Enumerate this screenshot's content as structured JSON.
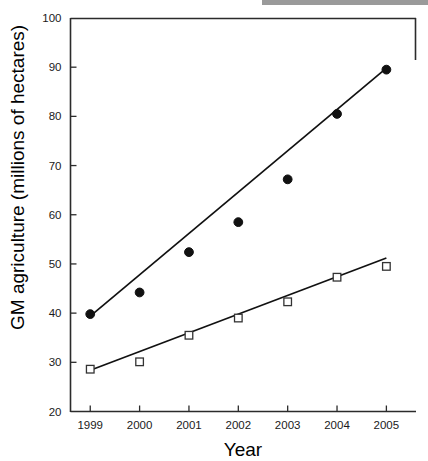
{
  "chart_data": {
    "type": "scatter",
    "title": "",
    "xlabel": "Year",
    "ylabel": "GM agriculture (millions of hectares)",
    "categories": [
      "1999",
      "2000",
      "2001",
      "2002",
      "2003",
      "2004",
      "2005"
    ],
    "x": [
      1999,
      2000,
      2001,
      2002,
      2003,
      2004,
      2005
    ],
    "xlim": [
      1998.6,
      2005.6
    ],
    "ylim": [
      20,
      100
    ],
    "yticks": [
      20,
      30,
      40,
      50,
      60,
      70,
      80,
      90,
      100
    ],
    "ytick_labels": [
      "20",
      "30",
      "40",
      "50",
      "60",
      "70",
      "80",
      "90",
      "100"
    ],
    "xticks": [
      1999,
      2000,
      2001,
      2002,
      2003,
      2004,
      2005
    ],
    "xtick_labels": [
      "1999",
      "2000",
      "2001",
      "2002",
      "2003",
      "2004",
      "2005"
    ],
    "grid": false,
    "legend": "none",
    "series": [
      {
        "name": "total GM area",
        "marker": "filled-circle",
        "color": "#111111",
        "values": [
          39.8,
          44.2,
          52.4,
          58.5,
          67.2,
          80.5,
          89.5
        ],
        "trendline": {
          "start_value": 39.4,
          "end_value": 89.8
        }
      },
      {
        "name": "GM area (second series)",
        "marker": "open-square",
        "color": "#333333",
        "values": [
          28.6,
          30.1,
          35.5,
          39.0,
          42.3,
          47.3,
          49.5
        ],
        "trendline": {
          "start_value": 28.4,
          "end_value": 51.2
        }
      }
    ]
  },
  "axis": {
    "y_title": "GM agriculture (millions of hectares)",
    "x_title": "Year"
  }
}
